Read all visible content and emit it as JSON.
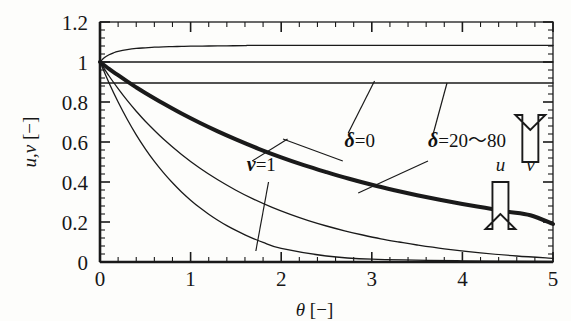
{
  "chart_data": {
    "type": "line",
    "title": "",
    "xlabel": "θ [−]",
    "ylabel": "u,v [−]",
    "xlim": [
      0,
      5
    ],
    "ylim": [
      0,
      1.2
    ],
    "xticks": [
      "0",
      "1",
      "2",
      "3",
      "4",
      "5"
    ],
    "xtick_values": [
      0,
      1,
      2,
      3,
      4,
      5
    ],
    "yticks": [
      "0",
      "0.2",
      "0.4",
      "0.6",
      "0.8",
      "1",
      "1.2"
    ],
    "ytick_values": [
      0,
      0.2,
      0.4,
      0.6,
      0.8,
      1.0,
      1.2
    ],
    "grid": false,
    "legend": "none",
    "minor_ticks_per_major_x": 5,
    "minor_ticks_per_major_y": 5,
    "annotations": [
      {
        "id": "nu-1",
        "text_parts": [
          "ν",
          "=1"
        ],
        "x": 1.62,
        "y": 0.455
      },
      {
        "id": "delta-0",
        "text_parts": [
          "δ",
          "=0"
        ],
        "x": 2.7,
        "y": 0.575
      },
      {
        "id": "delta-20-80",
        "text_parts": [
          "δ",
          "=20～80"
        ],
        "x": 3.62,
        "y": 0.575
      },
      {
        "id": "u-arrow-label",
        "text_parts": [
          "u"
        ],
        "x": 4.42,
        "y": 0.455
      },
      {
        "id": "v-arrow-label",
        "text_parts": [
          "v"
        ],
        "x": 4.75,
        "y": 0.455
      }
    ],
    "arrows": [
      {
        "id": "v-up-arrow",
        "direction": "up",
        "x": 4.75,
        "y_from": 0.5,
        "y_to": 0.66,
        "meaning": "v increases"
      },
      {
        "id": "u-down-arrow",
        "direction": "down",
        "x": 4.42,
        "y_from": 0.4,
        "y_to": 0.24,
        "meaning": "u decreases"
      }
    ],
    "series": [
      {
        "name": "v, δ=20~80 (plateau)",
        "role": "v",
        "style": "thin",
        "comment": "rises from 1 to plateau 1.083",
        "x": [
          0,
          0.05,
          0.1,
          0.15,
          0.2,
          0.3,
          0.4,
          0.5,
          0.6,
          0.7,
          0.8,
          0.9,
          1.0,
          1.2,
          1.4,
          1.6,
          1.65,
          2.0,
          2.5,
          3.0,
          3.5,
          4.0,
          4.5,
          5.0
        ],
        "y": [
          1.0,
          1.022,
          1.036,
          1.046,
          1.053,
          1.062,
          1.068,
          1.071,
          1.074,
          1.076,
          1.077,
          1.078,
          1.079,
          1.08,
          1.081,
          1.082,
          1.083,
          1.083,
          1.083,
          1.083,
          1.083,
          1.083,
          1.083,
          1.083
        ]
      },
      {
        "name": "v, δ=0 (constant)",
        "role": "v",
        "style": "thin",
        "comment": "horizontal line at 1.0",
        "x": [
          0,
          1,
          2,
          3,
          4,
          5
        ],
        "y": [
          1.0,
          1.0,
          1.0,
          1.0,
          1.0,
          1.0
        ]
      },
      {
        "name": "v, ν=1 (constant lower)",
        "role": "v",
        "style": "thin",
        "comment": "horizontal line at 0.895",
        "x": [
          0,
          1,
          2,
          3,
          4,
          5
        ],
        "y": [
          0.895,
          0.895,
          0.895,
          0.895,
          0.895,
          0.895
        ]
      },
      {
        "name": "u, δ=20~80",
        "role": "u",
        "style": "thick",
        "comment": "slow decay, reaches 0.19 at theta=5",
        "x": [
          0,
          0.1,
          0.2,
          0.3,
          0.4,
          0.5,
          0.7,
          0.9,
          1.1,
          1.3,
          1.5,
          1.75,
          2.0,
          2.25,
          2.5,
          2.75,
          3.0,
          3.25,
          3.5,
          3.75,
          4.0,
          4.25,
          4.5,
          4.75,
          5.0
        ],
        "y": [
          1.0,
          0.966,
          0.934,
          0.903,
          0.873,
          0.845,
          0.792,
          0.742,
          0.696,
          0.653,
          0.613,
          0.566,
          0.523,
          0.484,
          0.449,
          0.416,
          0.386,
          0.359,
          0.334,
          0.311,
          0.29,
          0.271,
          0.252,
          0.234,
          0.19
        ]
      },
      {
        "name": "u, δ=0",
        "role": "u",
        "style": "thin",
        "comment": "medium decay, approaches 0 around theta=3.5",
        "x": [
          0,
          0.1,
          0.2,
          0.3,
          0.4,
          0.5,
          0.7,
          0.9,
          1.1,
          1.3,
          1.5,
          1.7,
          1.9,
          2.1,
          2.3,
          2.5,
          2.7,
          2.9,
          3.1,
          3.3,
          3.5,
          3.8,
          4.2,
          4.6,
          5.0
        ],
        "y": [
          1.0,
          0.93,
          0.867,
          0.808,
          0.754,
          0.704,
          0.615,
          0.538,
          0.47,
          0.411,
          0.359,
          0.313,
          0.273,
          0.238,
          0.207,
          0.18,
          0.156,
          0.135,
          0.116,
          0.1,
          0.085,
          0.066,
          0.046,
          0.03,
          0.018
        ]
      },
      {
        "name": "u, ν=1",
        "role": "u",
        "style": "thin",
        "comment": "fast decay, reaches 0 near theta=1.7",
        "x": [
          0,
          0.1,
          0.2,
          0.3,
          0.4,
          0.5,
          0.6,
          0.7,
          0.8,
          0.9,
          1.0,
          1.1,
          1.2,
          1.3,
          1.4,
          1.5,
          1.6,
          1.7,
          1.8,
          2.0,
          2.5,
          3.0,
          4.0,
          5.0
        ],
        "y": [
          1.0,
          0.895,
          0.8,
          0.714,
          0.636,
          0.566,
          0.503,
          0.447,
          0.396,
          0.35,
          0.309,
          0.272,
          0.239,
          0.209,
          0.182,
          0.158,
          0.136,
          0.116,
          0.098,
          0.068,
          0.03,
          0.014,
          0.006,
          0.003
        ]
      }
    ]
  },
  "axes": {
    "x_axis_name": "theta-axis",
    "y_axis_name": "uv-axis"
  },
  "colors": {
    "line": "#1a1a1a",
    "axis": "#1a1a1a",
    "background": "#fdfdfb"
  }
}
